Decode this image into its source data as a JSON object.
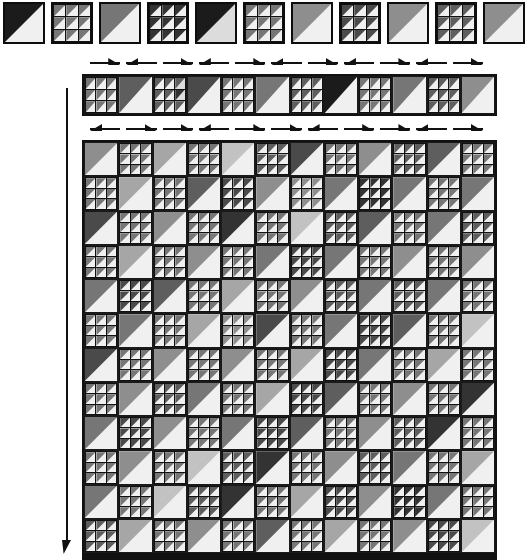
{
  "figure": {
    "type": "substitution-tiling-diagram",
    "background_color": "#ffffff",
    "ink_color": "#111111"
  },
  "palette": {
    "shades": [
      "#1b1b1b",
      "#333333",
      "#4a4a4a",
      "#5e5e5e",
      "#767676",
      "#8e8e8e",
      "#a6a6a6",
      "#c2c2c2",
      "#dcdcdc",
      "#f0f0f0"
    ],
    "grid_line": "#111111",
    "tile_border": "#0d0d0d"
  },
  "tile_types": {
    "solid": "single diagonal triangle tile, dark upper-left over light lower-right",
    "subdivided": "3x3 array of diagonal triangle sub-tiles"
  },
  "legend_row": {
    "name": "top-legend-row",
    "y": 2,
    "tile_size": 42,
    "gap": 6,
    "tiles": [
      {
        "type": "solid",
        "hi": 0,
        "lo": 9
      },
      {
        "type": "sub",
        "cells": [
          [
            4,
            9
          ],
          [
            4,
            9
          ],
          [
            4,
            9
          ],
          [
            4,
            9
          ],
          [
            4,
            9
          ],
          [
            4,
            9
          ],
          [
            4,
            9
          ],
          [
            4,
            9
          ],
          [
            4,
            9
          ]
        ]
      },
      {
        "type": "solid",
        "hi": 4,
        "lo": 9
      },
      {
        "type": "sub",
        "cells": [
          [
            1,
            9
          ],
          [
            1,
            9
          ],
          [
            1,
            9
          ],
          [
            1,
            9
          ],
          [
            1,
            9
          ],
          [
            1,
            9
          ],
          [
            1,
            9
          ],
          [
            1,
            9
          ],
          [
            1,
            9
          ]
        ]
      },
      {
        "type": "solid",
        "hi": 0,
        "lo": 8
      },
      {
        "type": "sub",
        "cells": [
          [
            4,
            9
          ],
          [
            4,
            9
          ],
          [
            4,
            9
          ],
          [
            4,
            9
          ],
          [
            4,
            9
          ],
          [
            4,
            9
          ],
          [
            4,
            9
          ],
          [
            4,
            9
          ],
          [
            4,
            9
          ]
        ]
      },
      {
        "type": "solid",
        "hi": 5,
        "lo": 9
      },
      {
        "type": "sub",
        "cells": [
          [
            2,
            9
          ],
          [
            2,
            9
          ],
          [
            2,
            9
          ],
          [
            2,
            9
          ],
          [
            2,
            9
          ],
          [
            2,
            9
          ],
          [
            2,
            9
          ],
          [
            2,
            9
          ],
          [
            2,
            9
          ]
        ]
      },
      {
        "type": "solid",
        "hi": 5,
        "lo": 9
      },
      {
        "type": "sub",
        "cells": [
          [
            3,
            9
          ],
          [
            3,
            9
          ],
          [
            3,
            9
          ],
          [
            3,
            9
          ],
          [
            3,
            9
          ],
          [
            3,
            9
          ],
          [
            3,
            9
          ],
          [
            3,
            9
          ],
          [
            3,
            9
          ]
        ]
      },
      {
        "type": "solid",
        "hi": 5,
        "lo": 9
      }
    ]
  },
  "arrow_row_top": {
    "name": "arrow-row-upper",
    "y": 58,
    "count": 11,
    "directions": [
      "right",
      "left",
      "right",
      "left",
      "right",
      "left",
      "right",
      "left",
      "right",
      "left",
      "right"
    ]
  },
  "strip_row": {
    "name": "horizontal-strip-row",
    "x": 82,
    "y": 74,
    "width": 415,
    "height": 42,
    "tile_count": 12,
    "tiles": [
      {
        "type": "sub",
        "cells": [
          [
            4,
            9
          ],
          [
            4,
            9
          ],
          [
            4,
            9
          ],
          [
            4,
            9
          ],
          [
            4,
            9
          ],
          [
            4,
            9
          ],
          [
            4,
            9
          ],
          [
            4,
            9
          ],
          [
            4,
            9
          ]
        ]
      },
      {
        "type": "solid",
        "hi": 3,
        "lo": 9
      },
      {
        "type": "sub",
        "cells": [
          [
            3,
            9
          ],
          [
            3,
            9
          ],
          [
            3,
            8
          ],
          [
            3,
            9
          ],
          [
            3,
            9
          ],
          [
            1,
            8
          ],
          [
            3,
            9
          ],
          [
            3,
            9
          ],
          [
            3,
            9
          ]
        ]
      },
      {
        "type": "solid",
        "hi": 2,
        "lo": 9
      },
      {
        "type": "sub",
        "cells": [
          [
            4,
            9
          ],
          [
            4,
            9
          ],
          [
            4,
            9
          ],
          [
            4,
            9
          ],
          [
            4,
            9
          ],
          [
            4,
            9
          ],
          [
            4,
            9
          ],
          [
            4,
            9
          ],
          [
            4,
            9
          ]
        ]
      },
      {
        "type": "solid",
        "hi": 4,
        "lo": 9
      },
      {
        "type": "sub",
        "cells": [
          [
            3,
            9
          ],
          [
            3,
            9
          ],
          [
            3,
            9
          ],
          [
            3,
            9
          ],
          [
            3,
            9
          ],
          [
            3,
            9
          ],
          [
            3,
            9
          ],
          [
            3,
            9
          ],
          [
            3,
            9
          ]
        ]
      },
      {
        "type": "solid",
        "hi": 0,
        "lo": 9
      },
      {
        "type": "sub",
        "cells": [
          [
            4,
            9
          ],
          [
            4,
            9
          ],
          [
            4,
            9
          ],
          [
            4,
            9
          ],
          [
            4,
            9
          ],
          [
            4,
            9
          ],
          [
            4,
            9
          ],
          [
            4,
            9
          ],
          [
            4,
            9
          ]
        ]
      },
      {
        "type": "solid",
        "hi": 4,
        "lo": 9
      },
      {
        "type": "sub",
        "cells": [
          [
            3,
            9
          ],
          [
            3,
            9
          ],
          [
            3,
            9
          ],
          [
            3,
            9
          ],
          [
            3,
            9
          ],
          [
            3,
            9
          ],
          [
            3,
            9
          ],
          [
            3,
            9
          ],
          [
            3,
            9
          ]
        ]
      },
      {
        "type": "solid",
        "hi": 5,
        "lo": 9
      }
    ]
  },
  "arrow_row_bottom": {
    "name": "arrow-row-lower",
    "y": 124,
    "count": 11,
    "directions": [
      "left",
      "right",
      "right",
      "left",
      "right",
      "right",
      "left",
      "right",
      "right",
      "left",
      "right"
    ]
  },
  "main_grid": {
    "name": "main-tiling-grid",
    "x": 82,
    "y": 140,
    "width": 415,
    "height": 420,
    "columns": 12,
    "rows": 12,
    "cell_size": 34.6,
    "parity_note": "checkerboard alternation of solid and subdivided tiles",
    "rows_data": [
      [
        [
          "s",
          5
        ],
        [
          "b",
          4
        ],
        [
          "s",
          6
        ],
        [
          "b",
          4
        ],
        [
          "s",
          7
        ],
        [
          "b",
          3
        ],
        [
          "s",
          2
        ],
        [
          "b",
          4
        ],
        [
          "s",
          5
        ],
        [
          "b",
          3
        ],
        [
          "s",
          3
        ],
        [
          "b",
          4
        ]
      ],
      [
        [
          "b",
          4
        ],
        [
          "s",
          6
        ],
        [
          "b",
          4
        ],
        [
          "s",
          3
        ],
        [
          "b",
          2
        ],
        [
          "s",
          5
        ],
        [
          "b",
          5
        ],
        [
          "s",
          4
        ],
        [
          "b",
          1
        ],
        [
          "s",
          4
        ],
        [
          "b",
          4
        ],
        [
          "s",
          4
        ]
      ],
      [
        [
          "s",
          2
        ],
        [
          "b",
          4
        ],
        [
          "s",
          5
        ],
        [
          "b",
          4
        ],
        [
          "s",
          1
        ],
        [
          "b",
          4
        ],
        [
          "s",
          7
        ],
        [
          "b",
          3
        ],
        [
          "s",
          3
        ],
        [
          "b",
          4
        ],
        [
          "s",
          4
        ],
        [
          "b",
          3
        ]
      ],
      [
        [
          "b",
          4
        ],
        [
          "s",
          6
        ],
        [
          "b",
          4
        ],
        [
          "s",
          5
        ],
        [
          "b",
          4
        ],
        [
          "s",
          4
        ],
        [
          "b",
          2
        ],
        [
          "s",
          4
        ],
        [
          "b",
          4
        ],
        [
          "s",
          5
        ],
        [
          "b",
          4
        ],
        [
          "s",
          5
        ]
      ],
      [
        [
          "s",
          4
        ],
        [
          "b",
          2
        ],
        [
          "s",
          3
        ],
        [
          "b",
          4
        ],
        [
          "s",
          6
        ],
        [
          "b",
          4
        ],
        [
          "s",
          5
        ],
        [
          "b",
          3
        ],
        [
          "s",
          4
        ],
        [
          "b",
          3
        ],
        [
          "s",
          4
        ],
        [
          "b",
          4
        ]
      ],
      [
        [
          "b",
          4
        ],
        [
          "s",
          4
        ],
        [
          "b",
          4
        ],
        [
          "s",
          6
        ],
        [
          "b",
          5
        ],
        [
          "s",
          2
        ],
        [
          "b",
          4
        ],
        [
          "s",
          4
        ],
        [
          "b",
          2
        ],
        [
          "s",
          3
        ],
        [
          "b",
          4
        ],
        [
          "s",
          7
        ]
      ],
      [
        [
          "s",
          2
        ],
        [
          "b",
          4
        ],
        [
          "s",
          5
        ],
        [
          "b",
          4
        ],
        [
          "s",
          5
        ],
        [
          "b",
          4
        ],
        [
          "s",
          6
        ],
        [
          "b",
          2
        ],
        [
          "s",
          4
        ],
        [
          "b",
          4
        ],
        [
          "s",
          6
        ],
        [
          "b",
          4
        ]
      ],
      [
        [
          "b",
          4
        ],
        [
          "s",
          5
        ],
        [
          "b",
          3
        ],
        [
          "s",
          4
        ],
        [
          "b",
          4
        ],
        [
          "s",
          6
        ],
        [
          "b",
          2
        ],
        [
          "s",
          3
        ],
        [
          "b",
          4
        ],
        [
          "s",
          5
        ],
        [
          "b",
          4
        ],
        [
          "s",
          1
        ]
      ],
      [
        [
          "s",
          4
        ],
        [
          "b",
          2
        ],
        [
          "s",
          5
        ],
        [
          "b",
          4
        ],
        [
          "s",
          4
        ],
        [
          "b",
          2
        ],
        [
          "s",
          3
        ],
        [
          "b",
          4
        ],
        [
          "s",
          5
        ],
        [
          "b",
          3
        ],
        [
          "s",
          1
        ],
        [
          "b",
          4
        ]
      ],
      [
        [
          "b",
          4
        ],
        [
          "s",
          5
        ],
        [
          "b",
          4
        ],
        [
          "s",
          7
        ],
        [
          "b",
          3
        ],
        [
          "s",
          1
        ],
        [
          "b",
          4
        ],
        [
          "s",
          5
        ],
        [
          "b",
          3
        ],
        [
          "s",
          4
        ],
        [
          "b",
          4
        ],
        [
          "s",
          6
        ]
      ],
      [
        [
          "s",
          4
        ],
        [
          "b",
          4
        ],
        [
          "s",
          7
        ],
        [
          "b",
          3
        ],
        [
          "s",
          1
        ],
        [
          "b",
          4
        ],
        [
          "s",
          6
        ],
        [
          "b",
          2
        ],
        [
          "s",
          5
        ],
        [
          "b",
          1
        ],
        [
          "s",
          4
        ],
        [
          "b",
          4
        ]
      ],
      [
        [
          "b",
          3
        ],
        [
          "s",
          6
        ],
        [
          "b",
          4
        ],
        [
          "s",
          5
        ],
        [
          "b",
          4
        ],
        [
          "s",
          3
        ],
        [
          "b",
          4
        ],
        [
          "s",
          6
        ],
        [
          "b",
          4
        ],
        [
          "s",
          5
        ],
        [
          "b",
          2
        ],
        [
          "s",
          7
        ]
      ]
    ]
  },
  "vertical_arrow": {
    "name": "vertical-direction-arrow",
    "x": 62,
    "y": 88,
    "height": 466,
    "direction": "down"
  }
}
